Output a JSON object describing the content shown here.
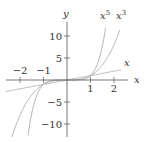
{
  "chart_data": {
    "type": "line",
    "title": "",
    "xlabel": "x",
    "ylabel": "y",
    "xlim": [
      -2.8,
      2.6
    ],
    "ylim": [
      -13,
      14
    ],
    "grid": false,
    "x_ticks": [
      "-2",
      "-1",
      "1",
      "2"
    ],
    "y_ticks": [
      "10",
      "5",
      "-5",
      "-10"
    ],
    "series": [
      {
        "name": "x",
        "label": "x",
        "expr": "y = x"
      },
      {
        "name": "x^3",
        "label": "x",
        "sup": "3",
        "expr": "y = x^3"
      },
      {
        "name": "x^5",
        "label": "x",
        "sup": "5",
        "expr": "y = x^5"
      }
    ],
    "colors": {
      "axis": "#555555",
      "curves": "#aaaaaa",
      "text": "#333333"
    }
  }
}
